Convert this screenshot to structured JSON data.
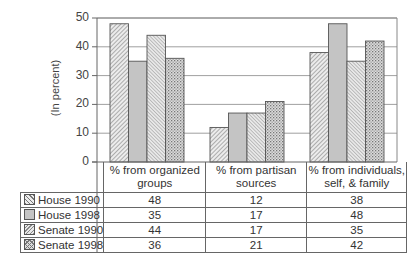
{
  "chart_data": {
    "type": "bar",
    "title": "",
    "xlabel": "",
    "ylabel": "(In percent)",
    "ylim": [
      0,
      50
    ],
    "yticks": [
      0,
      10,
      20,
      30,
      40,
      50
    ],
    "grid": true,
    "legend_position": "data table (left)",
    "categories": [
      "% from organized groups",
      "% from partisan sources",
      "% from individuals, self, & family"
    ],
    "category_lines": [
      [
        "% from organized",
        "groups"
      ],
      [
        "% from partisan",
        "sources"
      ],
      [
        "% from individuals,",
        "self, & family"
      ]
    ],
    "series": [
      {
        "name": "House 1990",
        "values": [
          48,
          12,
          38
        ],
        "pattern": "diagonal-hatch"
      },
      {
        "name": "House 1998",
        "values": [
          35,
          17,
          48
        ],
        "pattern": "solid-gray"
      },
      {
        "name": "Senate 1990",
        "values": [
          44,
          17,
          35
        ],
        "pattern": "dense-hatch"
      },
      {
        "name": "Senate 1998",
        "values": [
          36,
          21,
          42
        ],
        "pattern": "crosshatch-dots"
      }
    ]
  },
  "ylabel": "(In percent)",
  "yticks": [
    "0",
    "10",
    "20",
    "30",
    "40",
    "50"
  ],
  "table": {
    "headers": [
      [
        "% from organized",
        "groups"
      ],
      [
        "% from partisan",
        "sources"
      ],
      [
        "% from individuals,",
        "self, & family"
      ]
    ],
    "rows": [
      {
        "label": "House 1990",
        "values": [
          "48",
          "12",
          "38"
        ]
      },
      {
        "label": "House 1998",
        "values": [
          "35",
          "17",
          "48"
        ]
      },
      {
        "label": "Senate 1990",
        "values": [
          "44",
          "17",
          "35"
        ]
      },
      {
        "label": "Senate 1998",
        "values": [
          "36",
          "21",
          "42"
        ]
      }
    ]
  },
  "colors": {
    "axis": "#666666",
    "grid": "#888888",
    "bar_stroke": "#555555",
    "solid_gray": "#c4c4c4",
    "hatch_bg": "#e6e6e6"
  }
}
